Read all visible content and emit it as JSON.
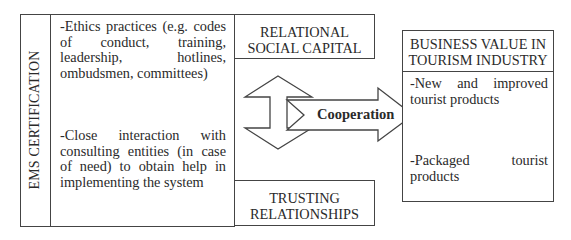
{
  "diagram": {
    "left_panel": {
      "vertical_label": "EMS CERTIFICATION",
      "items": [
        "-Ethics practices (e.g. codes of conduct, training, leadership, hotlines, ombudsmen, committees)",
        "-Close interaction with consulting entities (in case of need) to obtain help in implementing the system"
      ]
    },
    "middle": {
      "top_box": "RELATIONAL SOCIAL CAPITAL",
      "bottom_box": "TRUSTING RELATIONSHIPS",
      "arrow_label": "Cooperation"
    },
    "right_panel": {
      "title": "BUSINESS VALUE IN TOURISM INDUSTRY",
      "items": [
        "-New and improved tourist products",
        "-Packaged tourist products"
      ]
    },
    "colors": {
      "line": "#444444",
      "text": "#2a2a2a",
      "background": "#ffffff"
    }
  }
}
